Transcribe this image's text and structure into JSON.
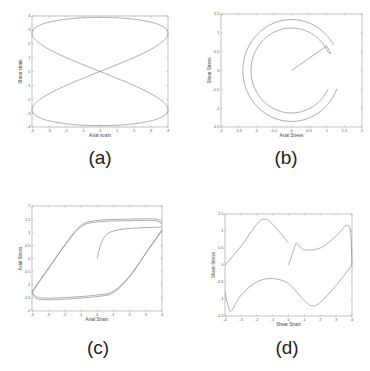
{
  "figure": {
    "captions": [
      "(a)",
      "(b)",
      "(c)",
      "(d)"
    ]
  },
  "chart_data": [
    {
      "id": "a",
      "type": "line",
      "caption": "(a)",
      "title": "",
      "xlabel": "Axial strain",
      "ylabel": "Shear strain",
      "xlim": [
        -4,
        4
      ],
      "ylim": [
        -4,
        4
      ],
      "xticks": [
        "-4",
        "-3",
        "-2",
        "-1",
        "0",
        "1",
        "2",
        "3",
        "4"
      ],
      "yticks": [
        "-4",
        "-3",
        "-2",
        "-1",
        "0",
        "1",
        "2",
        "3",
        "4"
      ],
      "grid": false,
      "description": "Lissajous figure-eight: axial strain 4sin(t), shear strain 4cos(t/2)-like bow-tie crossing at origin",
      "series": [
        {
          "name": "strain path",
          "shape": "lissajous",
          "x_amp": 4,
          "y_amp": 3.9
        }
      ]
    },
    {
      "id": "b",
      "type": "line",
      "caption": "(b)",
      "title": "",
      "xlabel": "Axial Stress",
      "ylabel": "Shear Stress",
      "xlim": [
        -2,
        2
      ],
      "ylim": [
        -1.5,
        1.5
      ],
      "xticks": [
        "-2",
        "-1.5",
        "-1",
        "-0.5",
        "0",
        "0.5",
        "1",
        "1.5",
        "2"
      ],
      "yticks": [
        "-1.5",
        "-1",
        "-0.5",
        "0",
        "0.5",
        "1",
        "1.5"
      ],
      "grid": false,
      "description": "Stress path starting at origin, rising to (1,0.65), then circling counter-clockwise in two near-circular arcs of radius ~1.15 and ~1.35",
      "series": [
        {
          "name": "initial",
          "x": [
            0,
            1.0
          ],
          "y": [
            0,
            0.65
          ]
        },
        {
          "name": "inner arc",
          "radius": 1.15,
          "start_deg": 25,
          "end_deg": 335
        },
        {
          "name": "outer arc",
          "radius": 1.38,
          "start_deg": 30,
          "end_deg": 340
        }
      ]
    },
    {
      "id": "c",
      "type": "line",
      "caption": "(c)",
      "title": "",
      "xlabel": "Axial Strain",
      "ylabel": "Axial Stress",
      "xlim": [
        -4,
        4
      ],
      "ylim": [
        -2,
        2
      ],
      "xticks": [
        "-4",
        "-3",
        "-2",
        "-1",
        "0",
        "1",
        "2",
        "3",
        "4"
      ],
      "yticks": [
        "-2",
        "-1.5",
        "-1",
        "-0.5",
        "0",
        "0.5",
        "1",
        "1.5",
        "2"
      ],
      "grid": false,
      "description": "Hysteresis loops: initial loading from origin to (0.8,1.0) then (4,1.2); saturated loops between ±1.5 stress",
      "series": [
        {
          "name": "initial loading",
          "x": [
            0,
            0.8,
            4
          ],
          "y": [
            0,
            1.0,
            1.2
          ]
        },
        {
          "name": "upper branch",
          "x": [
            -4,
            -3,
            -2,
            -1,
            0,
            2,
            3.6,
            4
          ],
          "y": [
            -1.3,
            -0.4,
            0.5,
            1.25,
            1.45,
            1.5,
            1.5,
            1.35
          ]
        },
        {
          "name": "lower branch",
          "x": [
            4,
            3,
            2,
            1,
            0,
            -2,
            -3.6,
            -4
          ],
          "y": [
            1.1,
            0.2,
            -0.7,
            -1.3,
            -1.45,
            -1.55,
            -1.55,
            -1.3
          ]
        }
      ]
    },
    {
      "id": "d",
      "type": "line",
      "caption": "(d)",
      "title": "",
      "xlabel": "Shear Strain",
      "ylabel": "Shear Stress",
      "xlim": [
        -4,
        4
      ],
      "ylim": [
        -1.5,
        1.5
      ],
      "xticks": [
        "-4",
        "-3",
        "-2",
        "-1",
        "0",
        "1",
        "2",
        "3",
        "4"
      ],
      "yticks": [
        "-1.5",
        "-1",
        "-0.5",
        "0",
        "0.5",
        "1",
        "1.5"
      ],
      "grid": false,
      "description": "Shear stress-strain response: initial rise from origin to (0.5,0.65), wavy upper branch peaking ~1.35 at -1.5, lower branch dipping to -1.35 at -3.6 and -1.2 at 1.5",
      "series": [
        {
          "name": "initial",
          "x": [
            0,
            0.4,
            0.5
          ],
          "y": [
            0,
            0.55,
            0.65
          ]
        },
        {
          "name": "branch 1",
          "x": [
            0.5,
            1,
            2,
            3,
            3.6,
            3.9,
            4
          ],
          "y": [
            0.65,
            0.45,
            0.5,
            0.85,
            1.15,
            1.0,
            0.0
          ]
        },
        {
          "name": "branch 2",
          "x": [
            4,
            3,
            2,
            1.5,
            1,
            0,
            -1,
            -2,
            -3,
            -3.6,
            -3.8,
            -4
          ],
          "y": [
            0.0,
            -0.6,
            -1.1,
            -1.2,
            -1.05,
            -0.55,
            -0.4,
            -0.5,
            -0.9,
            -1.35,
            -1.2,
            -0.8
          ]
        },
        {
          "name": "branch 3",
          "x": [
            -4,
            -3,
            -2,
            -1.5,
            -1,
            0
          ],
          "y": [
            0.0,
            0.55,
            1.2,
            1.35,
            1.2,
            0.65
          ]
        }
      ]
    }
  ]
}
